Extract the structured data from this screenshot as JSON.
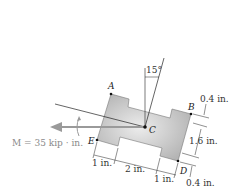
{
  "figure": {
    "moment_label": "M = 35 kip · in.",
    "angle_label": "15°",
    "points": {
      "A": "A",
      "B": "B",
      "C": "C",
      "D": "D",
      "E": "E"
    },
    "dimensions": {
      "top_flange": "0.4 in.",
      "web_height": "1.6 in.",
      "bottom_flange": "0.4 in.",
      "left_segment": "1 in.",
      "middle_segment": "2 in.",
      "right_segment": "1 in."
    },
    "colors": {
      "section_fill": "#c8c8c8",
      "moment_arrow": "#9a9a9a",
      "lines": "#222222"
    }
  }
}
